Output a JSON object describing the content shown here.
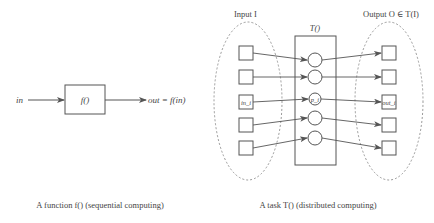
{
  "function_diagram": {
    "input_label": "in",
    "box_label": "f()",
    "output_label": "out = f(in)",
    "caption": "A function f() (sequential computing)"
  },
  "task_diagram": {
    "input_set_label": "Input I",
    "task_label": "T()",
    "output_set_label": "Output O ∈ T(I)",
    "inputs": [
      "",
      "",
      "in_i",
      "",
      ""
    ],
    "processes": [
      "",
      "",
      "p_i",
      "",
      ""
    ],
    "outputs": [
      "",
      "",
      "out_i",
      "",
      ""
    ],
    "caption": "A task T() (distributed computing)"
  },
  "colors": {
    "stroke": "#555555",
    "dashed": "#999999",
    "text": "#444444"
  }
}
